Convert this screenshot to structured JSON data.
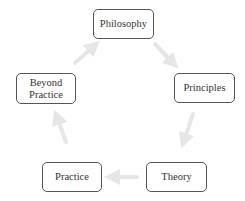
{
  "diagram": {
    "type": "cycle",
    "colors": {
      "border": "#555555",
      "text": "#333333",
      "arrow": "#e6e6e6",
      "background": "#ffffff"
    },
    "nodes": [
      {
        "id": "philosophy",
        "label": "Philosophy",
        "x": 93,
        "y": 9,
        "w": 61,
        "h": 30
      },
      {
        "id": "principles",
        "label": "Principles",
        "x": 174,
        "y": 73,
        "w": 61,
        "h": 30
      },
      {
        "id": "theory",
        "label": "Theory",
        "x": 146,
        "y": 162,
        "w": 61,
        "h": 30
      },
      {
        "id": "practice",
        "label": "Practice",
        "x": 42,
        "y": 162,
        "w": 60,
        "h": 30
      },
      {
        "id": "beyond-practice",
        "label": "Beyond\nPractice",
        "x": 16,
        "y": 73,
        "w": 60,
        "h": 31
      }
    ],
    "edges": [
      {
        "from": "philosophy",
        "to": "principles"
      },
      {
        "from": "principles",
        "to": "theory"
      },
      {
        "from": "theory",
        "to": "practice"
      },
      {
        "from": "practice",
        "to": "beyond-practice"
      },
      {
        "from": "beyond-practice",
        "to": "philosophy"
      }
    ]
  }
}
